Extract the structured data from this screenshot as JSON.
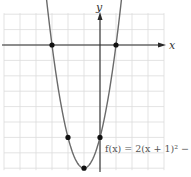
{
  "chart_data": {
    "type": "line",
    "title": "",
    "function_label": "f(x) = 2(x + 1)^2 − 8",
    "function_label_display": "f(x) = 2(x + 1)² − 8",
    "xlabel": "x",
    "ylabel": "y",
    "xlim": [
      -6,
      4
    ],
    "ylim": [
      -8,
      2
    ],
    "grid": true,
    "grid_step": 1,
    "tick_labels_shown": false,
    "series": [
      {
        "name": "f(x) = 2(x + 1)^2 − 8",
        "kind": "parabola",
        "a": 2,
        "h": -1,
        "k": -8,
        "x": [
          -3.6,
          -3,
          -2.5,
          -2,
          -1.5,
          -1,
          -0.5,
          0,
          0.5,
          1,
          1.6
        ],
        "values": [
          5.52,
          0,
          -3.5,
          -6,
          -7.5,
          -8,
          -7.5,
          -6,
          -3.5,
          0,
          5.52
        ]
      }
    ],
    "highlighted_points": [
      {
        "x": -3,
        "y": 0,
        "label": "x-intercept"
      },
      {
        "x": 1,
        "y": 0,
        "label": "x-intercept"
      },
      {
        "x": -2,
        "y": -6,
        "label": "point"
      },
      {
        "x": 0,
        "y": -6,
        "label": "y-intercept"
      },
      {
        "x": -1,
        "y": -8,
        "label": "vertex"
      }
    ],
    "colors": {
      "curve": "#6a6a6a",
      "axis": "#2a2a2a",
      "grid": "#dcdcdc",
      "points": "#111111"
    }
  },
  "axes": {
    "x_label": "x",
    "y_label": "y"
  }
}
